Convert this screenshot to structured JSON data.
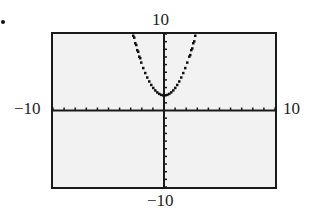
{
  "chart_data": {
    "type": "line",
    "title": "",
    "function": "y = x^2 + 2",
    "xlabel": "",
    "ylabel": "",
    "xlim": [
      -10,
      10
    ],
    "ylim": [
      -10,
      10
    ],
    "x_tick_step": 1,
    "y_tick_step": 1,
    "grid": false,
    "window_labels": {
      "xmin": "−10",
      "xmax": "10",
      "ymin": "−10",
      "ymax": "10"
    },
    "series": [
      {
        "name": "parabola",
        "style": "dotted-pixel",
        "x": [
          -2.8,
          -2.5,
          -2,
          -1.5,
          -1,
          -0.5,
          0,
          0.5,
          1,
          1.5,
          2,
          2.5,
          2.8
        ],
        "y": [
          9.84,
          8.25,
          6,
          4.25,
          3,
          2.25,
          2,
          2.25,
          3,
          4.25,
          6,
          8.25,
          9.84
        ]
      }
    ],
    "colors": {
      "background": "#f2f2f2",
      "frame": "#1a1a1a",
      "curve": "#111111"
    }
  }
}
